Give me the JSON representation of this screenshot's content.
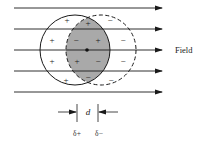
{
  "diagram": {
    "type": "polarization-of-atom-in-electric-field",
    "field_label": "Field",
    "separation_label": "d",
    "positive_center_label": "δ+",
    "negative_center_label": "δ−",
    "field_lines": [
      {
        "y": 8,
        "x1": 14,
        "x2": 162
      },
      {
        "y": 29,
        "x1": 14,
        "x2": 162
      },
      {
        "y": 50,
        "x1": 14,
        "x2": 162
      },
      {
        "y": 71,
        "x1": 14,
        "x2": 162
      },
      {
        "y": 92,
        "x1": 14,
        "x2": 162
      }
    ],
    "circles": {
      "positive_charge_cloud": {
        "cx": 75,
        "cy": 50,
        "r": 35,
        "style": "solid"
      },
      "negative_charge_cloud": {
        "cx": 101,
        "cy": 50,
        "r": 35,
        "style": "dashed"
      }
    },
    "overlap_fill_color": "#a9a9a9",
    "line_color": "#1a1a1a",
    "charge_signs": [
      {
        "sign": "+",
        "x": 67,
        "y": 20
      },
      {
        "sign": "+",
        "x": 88,
        "y": 23
      },
      {
        "sign": "−",
        "x": 110,
        "y": 20
      },
      {
        "sign": "+",
        "x": 52,
        "y": 40
      },
      {
        "sign": "−",
        "x": 76,
        "y": 40
      },
      {
        "sign": "+",
        "x": 98,
        "y": 40
      },
      {
        "sign": "−",
        "x": 123,
        "y": 40
      },
      {
        "sign": "+",
        "x": 52,
        "y": 61
      },
      {
        "sign": "+",
        "x": 77,
        "y": 61
      },
      {
        "sign": "−",
        "x": 98,
        "y": 61
      },
      {
        "sign": "−",
        "x": 123,
        "y": 61
      },
      {
        "sign": "+",
        "x": 66,
        "y": 80
      },
      {
        "sign": "−",
        "x": 88,
        "y": 77
      },
      {
        "sign": "−",
        "x": 111,
        "y": 80
      }
    ]
  }
}
